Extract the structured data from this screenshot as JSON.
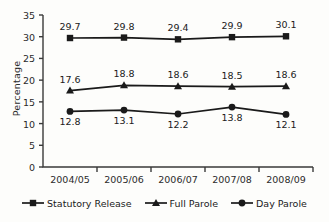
{
  "chart_data": {
    "type": "line",
    "title": "",
    "xlabel": "",
    "ylabel": "Percentage",
    "categories": [
      "2004/05",
      "2005/06",
      "2006/07",
      "2007/08",
      "2008/09"
    ],
    "ylim": [
      0,
      35
    ],
    "yticks": [
      0,
      5,
      10,
      15,
      20,
      25,
      30,
      35
    ],
    "ytick_labels": [
      "0",
      "5",
      "10",
      "15",
      "20",
      "25",
      "30",
      "35"
    ],
    "grid": false,
    "legend_position": "bottom",
    "series": [
      {
        "name": "Statutory Release",
        "marker": "square",
        "color": "#1a1a1a",
        "label_position": "above",
        "values": [
          29.7,
          29.8,
          29.4,
          29.9,
          30.1
        ],
        "value_labels": [
          "29.7",
          "29.8",
          "29.4",
          "29.9",
          "30.1"
        ]
      },
      {
        "name": "Full Parole",
        "marker": "triangle",
        "color": "#1a1a1a",
        "label_position": "above",
        "values": [
          17.6,
          18.8,
          18.6,
          18.5,
          18.6
        ],
        "value_labels": [
          "17.6",
          "18.8",
          "18.6",
          "18.5",
          "18.6"
        ]
      },
      {
        "name": "Day Parole",
        "marker": "circle",
        "color": "#1a1a1a",
        "label_position": "below",
        "values": [
          12.8,
          13.1,
          12.2,
          13.8,
          12.1
        ],
        "value_labels": [
          "12.8",
          "13.1",
          "12.2",
          "13.8",
          "12.1"
        ]
      }
    ]
  },
  "colors": {
    "ink": "#1a1a1a",
    "axis": "#3a3a3a",
    "background": "#fdfdfb"
  }
}
